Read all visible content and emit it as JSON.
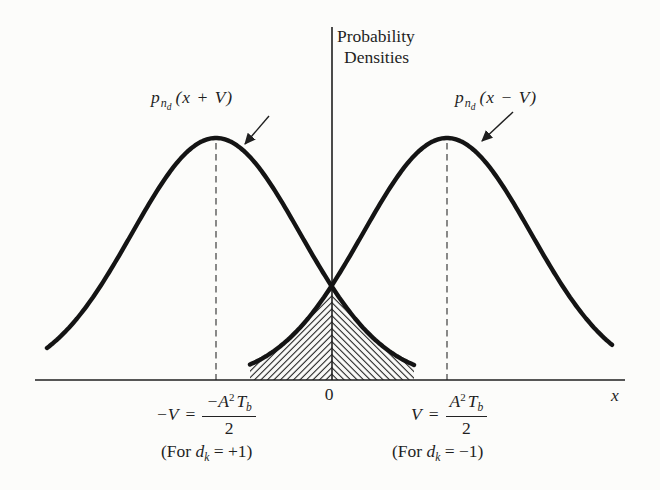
{
  "colors": {
    "paper": "#fcfcfa",
    "ink": "#1f1f1f",
    "curve": "#141414"
  },
  "title": {
    "line1": "Probability",
    "line2": "Densities"
  },
  "axes": {
    "origin_label": "0",
    "x_label": "x"
  },
  "curve_labels": {
    "left": {
      "fn": "p",
      "sub": "n",
      "subsub": "d",
      "arg": "(x + V)"
    },
    "right": {
      "fn": "p",
      "sub": "n",
      "subsub": "d",
      "arg": "(x − V)"
    }
  },
  "value_labels": {
    "left": {
      "lhs": "−V",
      "eq": "=",
      "num_main": "−A",
      "num_sup": "2",
      "num_T": "T",
      "num_sub": "b",
      "den": "2"
    },
    "right": {
      "lhs": "V",
      "eq": "=",
      "num_main": "A",
      "num_sup": "2",
      "num_T": "T",
      "num_sub": "b",
      "den": "2"
    }
  },
  "conditions": {
    "left": {
      "prefix": "(For ",
      "var": "d",
      "sub": "k",
      "suffix": " = +1)"
    },
    "right": {
      "prefix": "(For ",
      "var": "d",
      "sub": "k",
      "suffix": " = −1)"
    }
  },
  "geometry": {
    "width": 660,
    "height": 490,
    "baseline_y": 380,
    "axis_x": 332,
    "axis_top_y": 27,
    "x_axis": {
      "x1": 35,
      "x2": 625
    },
    "gauss": {
      "amp": 242,
      "sigma": 84,
      "center_left": 216,
      "center_right": 447
    },
    "left_curve_range": [
      47,
      414
    ],
    "right_curve_range": [
      250,
      612
    ],
    "hatch_range": [
      250,
      414
    ],
    "dashed": {
      "left_x": 216,
      "right_x": 447,
      "top_y": 143
    },
    "arrows": {
      "left": {
        "x1": 269,
        "y1": 116,
        "x2": 245,
        "y2": 144
      },
      "right": {
        "x1": 513,
        "y1": 112,
        "x2": 482,
        "y2": 141
      }
    }
  }
}
